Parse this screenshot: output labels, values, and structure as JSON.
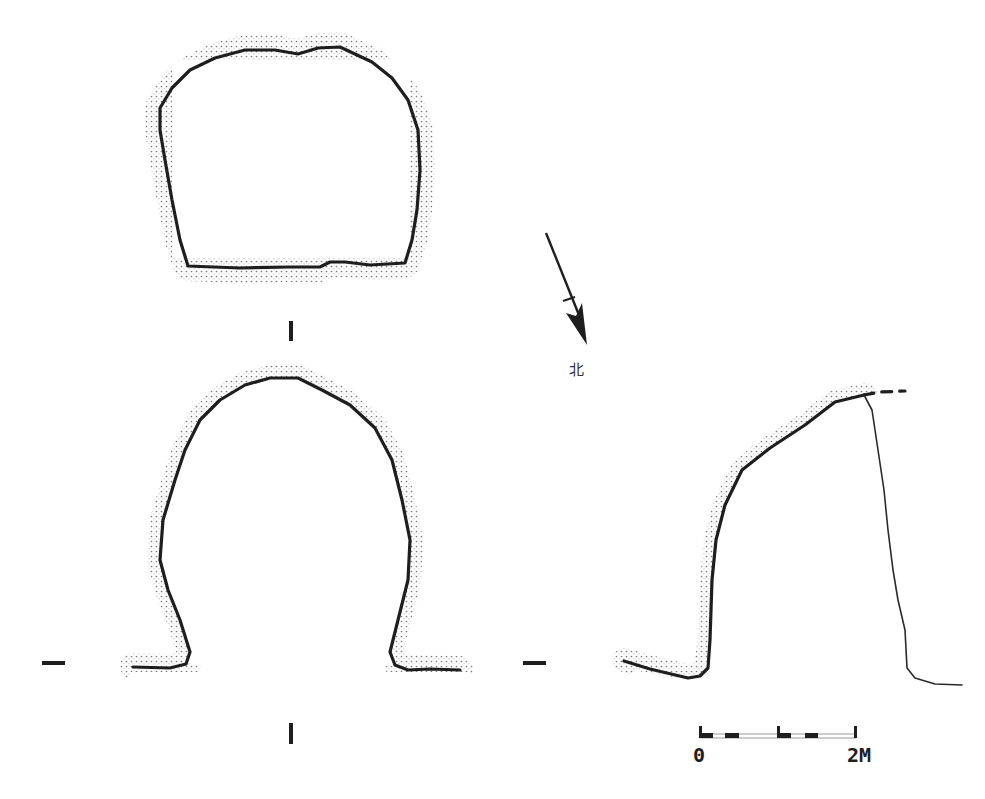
{
  "figure": {
    "type": "archaeological plan and section drawing",
    "views": [
      {
        "id": "plan",
        "description": "plan view, stippled rectangular outline"
      },
      {
        "id": "section-1",
        "description": "section I-I, arched profile"
      },
      {
        "id": "section-2",
        "description": "longitudinal section, one-sided arch with thin fill line"
      }
    ]
  },
  "labels": {
    "section_mark_top": "I",
    "section_mark_bottom": "I",
    "section_dash_left": "—",
    "section_dash_right": "—"
  },
  "north_arrow": {
    "icon": "north-arrow-icon",
    "label": "北"
  },
  "scale_bar": {
    "start_label": "0",
    "end_label": "2M",
    "segments": 4
  },
  "colors": {
    "ink": "#1e1e1e",
    "stipple": "#8a8a8a",
    "background": "#ffffff"
  }
}
